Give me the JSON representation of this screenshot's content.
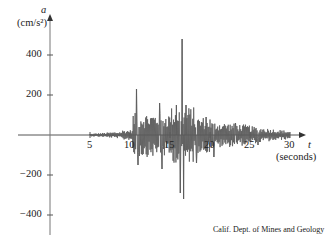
{
  "chart_data": {
    "type": "line",
    "title": "",
    "xlabel": "t (seconds)",
    "ylabel": "a (cm/s²)",
    "x_axis": {
      "symbol": "t",
      "unit_label": "(seconds)",
      "ticks": [
        5,
        10,
        15,
        20,
        25,
        30
      ],
      "range": [
        0,
        31
      ]
    },
    "y_axis": {
      "symbol": "a",
      "unit_label": "(cm/s²)",
      "ticks": [
        -400,
        -200,
        200,
        400
      ],
      "range": [
        -500,
        520
      ]
    },
    "grid": false,
    "legend": null,
    "annotation": "Calif. Dept. of Mines and Geology",
    "series": [
      {
        "name": "ground acceleration",
        "color": "#555555",
        "description": "Seismogram: near-zero before ~5 s, small oscillations 5–10 s, strong shaking 10–20 s, decaying after 20 s to ~30 s",
        "peaks": [
          {
            "t": 10.8,
            "a": 230
          },
          {
            "t": 11.0,
            "a": -150
          },
          {
            "t": 13.7,
            "a": 160
          },
          {
            "t": 14.0,
            "a": -170
          },
          {
            "t": 15.8,
            "a": 150
          },
          {
            "t": 16.3,
            "a": -290
          },
          {
            "t": 16.5,
            "a": 480
          },
          {
            "t": 16.7,
            "a": -320
          },
          {
            "t": 17.0,
            "a": 150
          },
          {
            "t": 18.3,
            "a": -140
          },
          {
            "t": 19.5,
            "a": 90
          },
          {
            "t": 20.5,
            "a": -110
          },
          {
            "t": 23.2,
            "a": 60
          },
          {
            "t": 26.0,
            "a": -50
          }
        ]
      }
    ]
  },
  "labels": {
    "y_symbol": "a",
    "y_unit": "(cm/s²)",
    "x_symbol": "t",
    "x_unit": "(seconds)",
    "y_ticks": [
      "400",
      "200",
      "−200",
      "−400"
    ],
    "x_ticks": [
      "5",
      "10",
      "15",
      "20",
      "25",
      "30"
    ],
    "credit": "Calif. Dept. of Mines and Geology"
  }
}
